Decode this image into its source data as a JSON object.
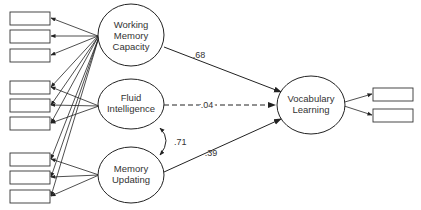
{
  "diagram": {
    "type": "structural-equation-model",
    "latent_variables": [
      {
        "id": "wmc",
        "label_lines": [
          "Working",
          "Memory",
          "Capacity"
        ]
      },
      {
        "id": "fi",
        "label_lines": [
          "Fluid",
          "Intelligence"
        ]
      },
      {
        "id": "mu",
        "label_lines": [
          "Memory",
          "Updating"
        ]
      },
      {
        "id": "vl",
        "label_lines": [
          "Vocabulary",
          "Learning"
        ]
      }
    ],
    "paths": [
      {
        "from": "Working Memory Capacity",
        "to": "Vocabulary Learning",
        "coefficient": ".68",
        "style": "solid"
      },
      {
        "from": "Fluid Intelligence",
        "to": "Vocabulary Learning",
        "coefficient": ".04",
        "style": "dashed"
      },
      {
        "from": "Memory Updating",
        "to": "Vocabulary Learning",
        "coefficient": ".39",
        "style": "solid"
      }
    ],
    "correlations": [
      {
        "between": [
          "Fluid Intelligence",
          "Memory Updating"
        ],
        "coefficient": ".71"
      }
    ],
    "indicators": {
      "left_count": 9,
      "right_count": 2
    },
    "colors": {
      "line": "#222222",
      "text": "#333333",
      "background": "#ffffff"
    }
  }
}
